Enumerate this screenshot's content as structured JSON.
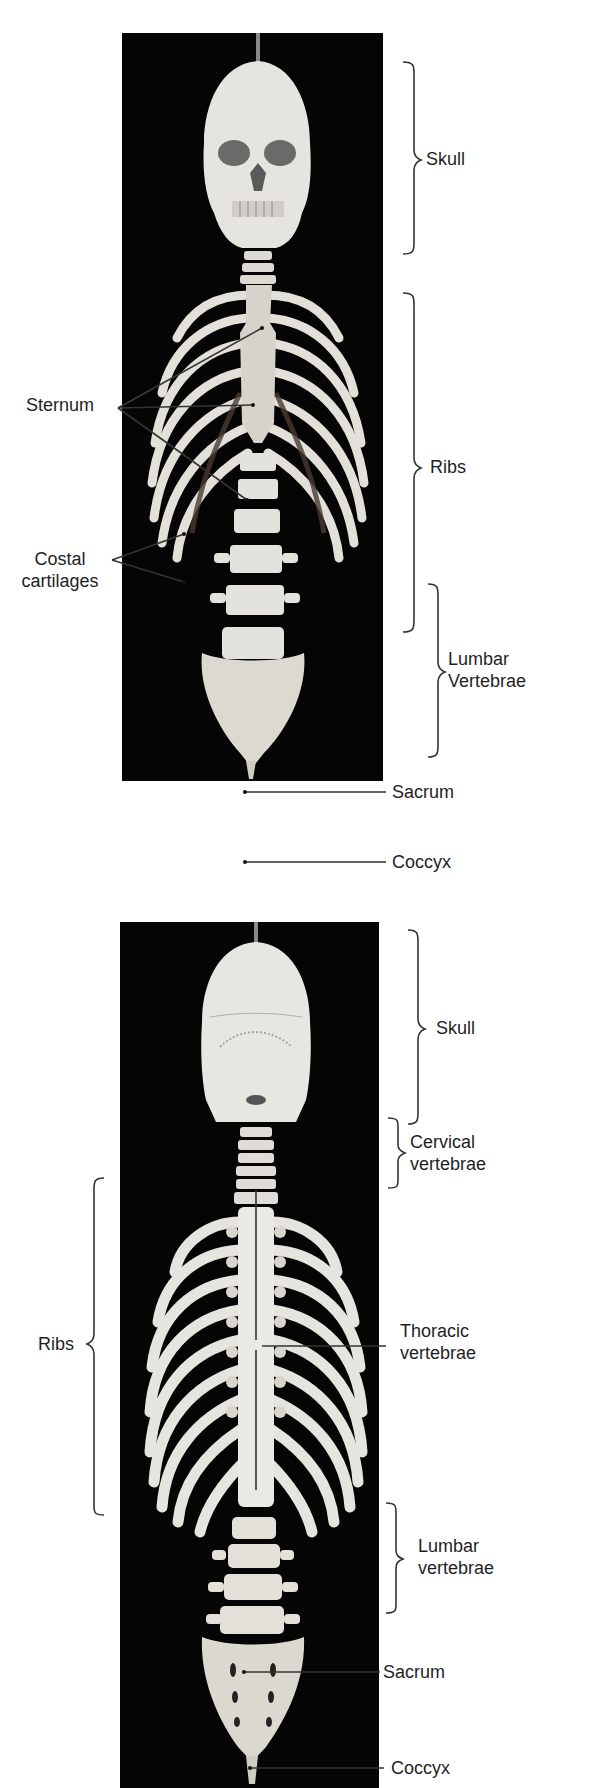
{
  "figure": {
    "panels": [
      {
        "id": "anterior",
        "view": "anterior view of axial skeleton",
        "labels": {
          "skull": "Skull",
          "ribs": "Ribs",
          "sternum": "Sternum",
          "costal_line1": "Costal",
          "costal_line2": "cartilages",
          "lumbar_line1": "Lumbar",
          "lumbar_line2": "Vertebrae",
          "sacrum": "Sacrum",
          "coccyx": "Coccyx"
        }
      },
      {
        "id": "posterior",
        "view": "posterior view of axial skeleton",
        "labels": {
          "skull": "Skull",
          "cervical_line1": "Cervical",
          "cervical_line2": "vertebrae",
          "ribs": "Ribs",
          "thoracic_line1": "Thoracic",
          "thoracic_line2": "vertebrae",
          "lumbar_line1": "Lumbar",
          "lumbar_line2": "vertebrae",
          "sacrum": "Sacrum",
          "coccyx": "Coccyx"
        }
      }
    ],
    "colors": {
      "background": "#ffffff",
      "photo_background": "#050505",
      "bone": "#e8e6e0",
      "leader_line": "#333333"
    }
  }
}
